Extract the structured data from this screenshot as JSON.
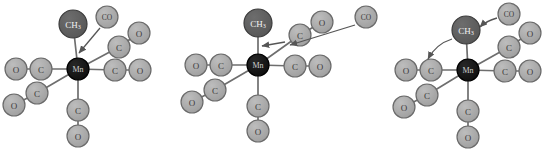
{
  "diagram": {
    "type": "reaction-mechanism",
    "background_color": "#ffffff",
    "palette": {
      "ligand_fill": "#a8a8a8",
      "ligand_stroke": "#6a6a6a",
      "methyl_fill": "#5d5d5d",
      "methyl_stroke": "#3c3c3c",
      "metal_fill": "#141414",
      "metal_stroke": "#000000",
      "bond_color": "#6e6e6e",
      "arrow_color": "#555555",
      "light_label_color": "#3a3a3a",
      "dark_label_color": "#f2f2f2"
    },
    "labels": {
      "metal": "Mn",
      "methyl": "CH",
      "methyl_subscript": "3",
      "carbon": "C",
      "oxygen": "O",
      "carbonyl": "CO"
    },
    "panels": [
      {
        "id": "panel-1",
        "name": "incoming-co-approaches-metal",
        "center": {
          "x": 78,
          "y": 69
        },
        "metal_radius": 11,
        "ligand_radius": 11,
        "methyl_radius": 14,
        "co_radius": 11,
        "atoms": [
          {
            "name": "metal-center",
            "label": "Mn",
            "kind": "metal",
            "x": 78,
            "y": 69,
            "r": 11
          },
          {
            "name": "methyl-group",
            "label": "CH3",
            "kind": "methyl",
            "x": 73,
            "y": 24,
            "r": 14
          },
          {
            "name": "carbonyl-left-carbon",
            "label": "C",
            "kind": "ligand",
            "x": 41,
            "y": 69,
            "r": 11
          },
          {
            "name": "carbonyl-left-oxygen",
            "label": "O",
            "kind": "ligand",
            "x": 16,
            "y": 69,
            "r": 11
          },
          {
            "name": "carbonyl-right-carbon",
            "label": "C",
            "kind": "ligand",
            "x": 115,
            "y": 70,
            "r": 11
          },
          {
            "name": "carbonyl-right-oxygen",
            "label": "O",
            "kind": "ligand",
            "x": 140,
            "y": 70,
            "r": 11
          },
          {
            "name": "carbonyl-upper-right-carbon",
            "label": "C",
            "kind": "ligand",
            "x": 119,
            "y": 47,
            "r": 11
          },
          {
            "name": "carbonyl-upper-right-oxygen",
            "label": "O",
            "kind": "ligand",
            "x": 139,
            "y": 33,
            "r": 11
          },
          {
            "name": "carbonyl-lower-left-carbon",
            "label": "C",
            "kind": "ligand",
            "x": 37,
            "y": 93,
            "r": 11
          },
          {
            "name": "carbonyl-lower-left-oxygen",
            "label": "O",
            "kind": "ligand",
            "x": 14,
            "y": 105,
            "r": 11
          },
          {
            "name": "carbonyl-bottom-carbon",
            "label": "C",
            "kind": "ligand",
            "x": 78,
            "y": 110,
            "r": 11
          },
          {
            "name": "carbonyl-bottom-oxygen",
            "label": "O",
            "kind": "ligand",
            "x": 78,
            "y": 136,
            "r": 11
          },
          {
            "name": "incoming-carbonyl",
            "label": "CO",
            "kind": "ligand",
            "x": 107,
            "y": 17,
            "r": 11
          }
        ],
        "bonds": [
          {
            "name": "bond-metal-methyl",
            "x1": 78,
            "y1": 69,
            "x2": 73,
            "y2": 24
          },
          {
            "name": "bond-metal-left-carbon",
            "x1": 78,
            "y1": 69,
            "x2": 41,
            "y2": 69
          },
          {
            "name": "bond-left-carbon-oxygen",
            "x1": 41,
            "y1": 69,
            "x2": 16,
            "y2": 69
          },
          {
            "name": "bond-metal-right-carbon",
            "x1": 78,
            "y1": 69,
            "x2": 115,
            "y2": 70
          },
          {
            "name": "bond-right-carbon-oxygen",
            "x1": 115,
            "y1": 70,
            "x2": 140,
            "y2": 70
          },
          {
            "name": "bond-metal-upper-right-carbon",
            "x1": 78,
            "y1": 69,
            "x2": 119,
            "y2": 47
          },
          {
            "name": "bond-upper-right-carbon-oxygen",
            "x1": 119,
            "y1": 47,
            "x2": 139,
            "y2": 33
          },
          {
            "name": "bond-metal-lower-left-carbon",
            "x1": 78,
            "y1": 69,
            "x2": 37,
            "y2": 93
          },
          {
            "name": "bond-lower-left-carbon-oxygen",
            "x1": 37,
            "y1": 93,
            "x2": 14,
            "y2": 105
          },
          {
            "name": "bond-metal-bottom-carbon",
            "x1": 78,
            "y1": 69,
            "x2": 78,
            "y2": 110
          },
          {
            "name": "bond-bottom-carbon-oxygen",
            "x1": 78,
            "y1": 110,
            "x2": 78,
            "y2": 136
          }
        ],
        "arrows": [
          {
            "name": "arrow-co-attacks-metal",
            "style": "straight",
            "path": "M 100 28 L 79 53",
            "description": "incoming CO approaches the manganese centre"
          }
        ]
      },
      {
        "id": "panel-2",
        "name": "methyl-migration-co-insertion",
        "center": {
          "x": 258,
          "y": 65
        },
        "atoms": [
          {
            "name": "metal-center",
            "label": "Mn",
            "kind": "metal",
            "x": 258,
            "y": 65,
            "r": 11
          },
          {
            "name": "methyl-group",
            "label": "CH3",
            "kind": "methyl",
            "x": 258,
            "y": 23,
            "r": 14
          },
          {
            "name": "carbonyl-left-carbon",
            "label": "C",
            "kind": "ligand",
            "x": 221,
            "y": 65,
            "r": 11
          },
          {
            "name": "carbonyl-left-oxygen",
            "label": "O",
            "kind": "ligand",
            "x": 196,
            "y": 65,
            "r": 11
          },
          {
            "name": "carbonyl-right-carbon",
            "label": "C",
            "kind": "ligand",
            "x": 295,
            "y": 66,
            "r": 11
          },
          {
            "name": "carbonyl-right-oxygen",
            "label": "O",
            "kind": "ligand",
            "x": 320,
            "y": 66,
            "r": 11
          },
          {
            "name": "carbonyl-upper-right-carbon",
            "label": "C",
            "kind": "ligand",
            "x": 300,
            "y": 35,
            "r": 11
          },
          {
            "name": "carbonyl-upper-right-oxygen",
            "label": "O",
            "kind": "ligand",
            "x": 322,
            "y": 22,
            "r": 11
          },
          {
            "name": "carbonyl-lower-left-carbon",
            "label": "C",
            "kind": "ligand",
            "x": 215,
            "y": 90,
            "r": 11
          },
          {
            "name": "carbonyl-lower-left-oxygen",
            "label": "O",
            "kind": "ligand",
            "x": 192,
            "y": 102,
            "r": 11
          },
          {
            "name": "carbonyl-bottom-carbon",
            "label": "C",
            "kind": "ligand",
            "x": 258,
            "y": 106,
            "r": 11
          },
          {
            "name": "carbonyl-bottom-oxygen",
            "label": "O",
            "kind": "ligand",
            "x": 258,
            "y": 131,
            "r": 11
          },
          {
            "name": "incoming-carbonyl",
            "label": "CO",
            "kind": "ligand",
            "x": 366,
            "y": 17,
            "r": 11
          }
        ],
        "bonds": [
          {
            "name": "bond-metal-methyl",
            "x1": 258,
            "y1": 65,
            "x2": 258,
            "y2": 23
          },
          {
            "name": "bond-metal-left-carbon",
            "x1": 258,
            "y1": 65,
            "x2": 221,
            "y2": 65
          },
          {
            "name": "bond-left-carbon-oxygen",
            "x1": 221,
            "y1": 65,
            "x2": 196,
            "y2": 65
          },
          {
            "name": "bond-metal-right-carbon",
            "x1": 258,
            "y1": 65,
            "x2": 295,
            "y2": 66
          },
          {
            "name": "bond-right-carbon-oxygen",
            "x1": 295,
            "y1": 66,
            "x2": 320,
            "y2": 66
          },
          {
            "name": "bond-metal-upper-right-carbon",
            "x1": 258,
            "y1": 65,
            "x2": 300,
            "y2": 35
          },
          {
            "name": "bond-upper-right-carbon-oxygen",
            "x1": 300,
            "y1": 35,
            "x2": 322,
            "y2": 22
          },
          {
            "name": "bond-metal-lower-left-carbon",
            "x1": 258,
            "y1": 65,
            "x2": 215,
            "y2": 90
          },
          {
            "name": "bond-lower-left-carbon-oxygen",
            "x1": 215,
            "y1": 90,
            "x2": 192,
            "y2": 102
          },
          {
            "name": "bond-metal-bottom-carbon",
            "x1": 258,
            "y1": 65,
            "x2": 258,
            "y2": 106
          },
          {
            "name": "bond-bottom-carbon-oxygen",
            "x1": 258,
            "y1": 106,
            "x2": 258,
            "y2": 131
          }
        ],
        "arrows": [
          {
            "name": "arrow-co-approaches-vacant-site",
            "style": "straight",
            "path": "M 355 25 L 290 45",
            "description": "free CO travels toward the vacant coordination site"
          },
          {
            "name": "arrow-methyl-migrates",
            "style": "straight",
            "path": "M 285 42 L 262 46",
            "description": "methyl migration onto the adjacent carbonyl"
          }
        ]
      },
      {
        "id": "panel-3",
        "name": "acyl-product-with-coordinated-co",
        "center": {
          "x": 468,
          "y": 70
        },
        "atoms": [
          {
            "name": "metal-center",
            "label": "Mn",
            "kind": "metal",
            "x": 468,
            "y": 70,
            "r": 11
          },
          {
            "name": "methyl-group",
            "label": "CH3",
            "kind": "methyl",
            "x": 466,
            "y": 30,
            "r": 14
          },
          {
            "name": "carbonyl-left-carbon",
            "label": "C",
            "kind": "ligand",
            "x": 431,
            "y": 70,
            "r": 11
          },
          {
            "name": "carbonyl-left-oxygen",
            "label": "O",
            "kind": "ligand",
            "x": 406,
            "y": 70,
            "r": 11
          },
          {
            "name": "carbonyl-right-carbon",
            "label": "C",
            "kind": "ligand",
            "x": 505,
            "y": 71,
            "r": 11
          },
          {
            "name": "carbonyl-right-oxygen",
            "label": "O",
            "kind": "ligand",
            "x": 530,
            "y": 71,
            "r": 11
          },
          {
            "name": "carbonyl-upper-right-carbon",
            "label": "C",
            "kind": "ligand",
            "x": 509,
            "y": 47,
            "r": 11
          },
          {
            "name": "carbonyl-upper-right-oxygen",
            "label": "O",
            "kind": "ligand",
            "x": 530,
            "y": 33,
            "r": 11
          },
          {
            "name": "carbonyl-lower-left-carbon",
            "label": "C",
            "kind": "ligand",
            "x": 427,
            "y": 95,
            "r": 11
          },
          {
            "name": "carbonyl-lower-left-oxygen",
            "label": "O",
            "kind": "ligand",
            "x": 404,
            "y": 107,
            "r": 11
          },
          {
            "name": "carbonyl-bottom-carbon",
            "label": "C",
            "kind": "ligand",
            "x": 468,
            "y": 111,
            "r": 11
          },
          {
            "name": "carbonyl-bottom-oxygen",
            "label": "O",
            "kind": "ligand",
            "x": 468,
            "y": 137,
            "r": 11
          },
          {
            "name": "incoming-carbonyl",
            "label": "CO",
            "kind": "ligand",
            "x": 509,
            "y": 14,
            "r": 11
          }
        ],
        "bonds": [
          {
            "name": "bond-metal-methyl",
            "x1": 468,
            "y1": 70,
            "x2": 466,
            "y2": 30
          },
          {
            "name": "bond-metal-left-carbon",
            "x1": 468,
            "y1": 70,
            "x2": 431,
            "y2": 70
          },
          {
            "name": "bond-left-carbon-oxygen",
            "x1": 431,
            "y1": 70,
            "x2": 406,
            "y2": 70
          },
          {
            "name": "bond-metal-right-carbon",
            "x1": 468,
            "y1": 70,
            "x2": 505,
            "y2": 71
          },
          {
            "name": "bond-right-carbon-oxygen",
            "x1": 505,
            "y1": 71,
            "x2": 530,
            "y2": 71
          },
          {
            "name": "bond-metal-upper-right-carbon",
            "x1": 468,
            "y1": 70,
            "x2": 509,
            "y2": 47
          },
          {
            "name": "bond-upper-right-carbon-oxygen",
            "x1": 509,
            "y1": 47,
            "x2": 530,
            "y2": 33
          },
          {
            "name": "bond-metal-lower-left-carbon",
            "x1": 468,
            "y1": 70,
            "x2": 427,
            "y2": 95
          },
          {
            "name": "bond-lower-left-carbon-oxygen",
            "x1": 427,
            "y1": 95,
            "x2": 404,
            "y2": 107
          },
          {
            "name": "bond-metal-bottom-carbon",
            "x1": 468,
            "y1": 70,
            "x2": 468,
            "y2": 111
          },
          {
            "name": "bond-bottom-carbon-oxygen",
            "x1": 468,
            "y1": 111,
            "x2": 468,
            "y2": 137
          }
        ],
        "arrows": [
          {
            "name": "arrow-co-binds-curved",
            "style": "curved",
            "path": "M 497 18 Q 486 21 480 27",
            "description": "CO binds to the metal, curved arrow toward methyl side"
          },
          {
            "name": "arrow-methyl-shifts-curved",
            "style": "curved",
            "path": "M 452 39 Q 436 44 428 59",
            "description": "curved arrow showing methyl shifting to the left carbonyl"
          }
        ]
      }
    ]
  }
}
